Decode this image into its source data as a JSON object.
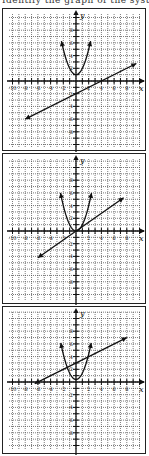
{
  "header": {
    "clipped_text": "Identify the graph of the system..."
  },
  "axes": {
    "x_label": "x",
    "y_label": "y",
    "x_ticks": [
      -10,
      -8,
      -6,
      -4,
      -2,
      2,
      4,
      6,
      8
    ],
    "y_ticks": [
      8,
      6,
      4,
      2,
      -2,
      -4,
      -6,
      -8
    ],
    "range": [
      -10,
      10
    ]
  },
  "panels": [
    {
      "id": "option-1",
      "parabola": {
        "a": 1,
        "k": 1,
        "x_min": -2.3,
        "x_max": 2.3
      },
      "line": {
        "slope": 0.5,
        "intercept": -2,
        "x_start": -8,
        "x_end": 9.5
      }
    },
    {
      "id": "option-2",
      "parabola": {
        "a": 1,
        "k": 0,
        "x_min": -2.45,
        "x_max": 2.45
      },
      "line": {
        "slope": 0.7,
        "intercept": 0,
        "x_start": -6,
        "x_end": 7.5
      }
    },
    {
      "id": "option-3",
      "parabola": {
        "a": 1,
        "k": 0.4,
        "x_min": -2.4,
        "x_max": 2.4
      },
      "line": {
        "slope": 0.5,
        "intercept": 3,
        "x_start": -6.5,
        "x_end": 8
      }
    }
  ],
  "chart_data": [
    {
      "type": "line",
      "title": "Graph A",
      "xlabel": "x",
      "ylabel": "y",
      "xlim": [
        -10,
        10
      ],
      "ylim": [
        -10,
        10
      ],
      "grid": true,
      "series": [
        {
          "name": "parabola",
          "equation": "y = x^2 + 1"
        },
        {
          "name": "line",
          "equation": "y = 0.5x - 2"
        }
      ]
    },
    {
      "type": "line",
      "title": "Graph B",
      "xlabel": "x",
      "ylabel": "y",
      "xlim": [
        -10,
        10
      ],
      "ylim": [
        -10,
        10
      ],
      "grid": true,
      "series": [
        {
          "name": "parabola",
          "equation": "y = x^2"
        },
        {
          "name": "line",
          "equation": "y = 0.7x"
        }
      ]
    },
    {
      "type": "line",
      "title": "Graph C",
      "xlabel": "x",
      "ylabel": "y",
      "xlim": [
        -10,
        10
      ],
      "ylim": [
        -10,
        10
      ],
      "grid": true,
      "series": [
        {
          "name": "parabola",
          "equation": "y = x^2"
        },
        {
          "name": "line",
          "equation": "y = 0.5x + 3"
        }
      ]
    }
  ]
}
